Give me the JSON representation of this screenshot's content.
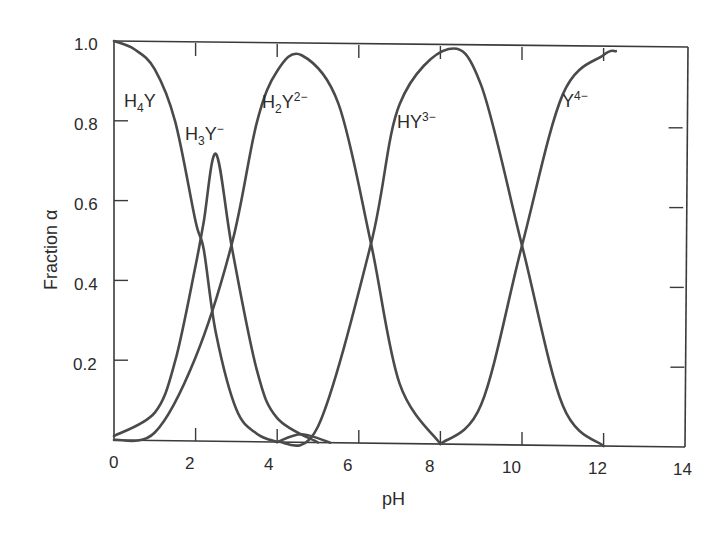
{
  "chart_data": {
    "type": "line",
    "title": "",
    "xlabel": "pH",
    "ylabel": "Fraction α",
    "xlim": [
      0,
      14
    ],
    "ylim": [
      0,
      1.0
    ],
    "grid": false,
    "legend": "inline labels",
    "x_ticks": [
      "0",
      "2",
      "4",
      "6",
      "8",
      "10",
      "12",
      "14"
    ],
    "y_ticks": [
      "0.2",
      "0.4",
      "0.6",
      "0.8",
      "1.0"
    ],
    "pKa": [
      2.1,
      2.9,
      6.3,
      10.0
    ],
    "series": [
      {
        "name": "H4Y",
        "label_main": "H",
        "label_sub": "4",
        "label_tail": "Y",
        "label_sup": "",
        "x": [
          0,
          0.5,
          1.0,
          1.5,
          2.0,
          2.2,
          2.5,
          3.0,
          3.5,
          4.0
        ],
        "values": [
          1.0,
          0.98,
          0.93,
          0.8,
          0.55,
          0.48,
          0.27,
          0.08,
          0.02,
          0.0
        ]
      },
      {
        "name": "H3Y-",
        "label_main": "H",
        "label_sub": "3",
        "label_tail": "Y",
        "label_sup": "−",
        "x": [
          0,
          1.0,
          1.5,
          2.0,
          2.2,
          2.5,
          2.9,
          3.5,
          4.0,
          5.0
        ],
        "values": [
          0.01,
          0.07,
          0.2,
          0.44,
          0.55,
          0.72,
          0.48,
          0.18,
          0.06,
          0.0
        ]
      },
      {
        "name": "H2Y2-",
        "label_main": "H",
        "label_sub": "2",
        "label_tail": "Y",
        "label_sup": "2−",
        "x": [
          0,
          1.0,
          2.0,
          2.9,
          3.5,
          4.0,
          4.6,
          5.5,
          6.3,
          7.0,
          8.0
        ],
        "values": [
          0.0,
          0.02,
          0.21,
          0.5,
          0.8,
          0.93,
          0.97,
          0.85,
          0.5,
          0.15,
          0.0
        ]
      },
      {
        "name": "HY3-",
        "label_main": "HY",
        "label_sub": "",
        "label_tail": "",
        "label_sup": "3−",
        "x": [
          4.0,
          5.0,
          6.3,
          7.0,
          8.2,
          9.0,
          10.0,
          11.0,
          12.0
        ],
        "values": [
          0.0,
          0.04,
          0.5,
          0.85,
          0.99,
          0.9,
          0.5,
          0.1,
          0.0
        ]
      },
      {
        "name": "Y4-",
        "label_main": "Y",
        "label_sub": "",
        "label_tail": "",
        "label_sup": "4−",
        "x": [
          8.0,
          9.0,
          10.0,
          11.0,
          12.0,
          12.3
        ],
        "values": [
          0.0,
          0.1,
          0.5,
          0.88,
          0.98,
          0.99
        ]
      },
      {
        "name": "minor-bump",
        "label_main": "",
        "label_sub": "",
        "label_tail": "",
        "label_sup": "",
        "x": [
          4.0,
          4.6,
          5.3
        ],
        "values": [
          0.0,
          0.02,
          0.0
        ]
      }
    ]
  },
  "labels": {
    "xlabel": "pH",
    "ylabel": "Fraction α",
    "x_ticks": [
      "0",
      "2",
      "4",
      "6",
      "8",
      "10",
      "12",
      "14"
    ],
    "y_ticks": [
      "0.2",
      "0.4",
      "0.6",
      "0.8",
      "1.0"
    ],
    "species": [
      {
        "main": "H",
        "sub": "4",
        "tail": "Y",
        "sup": ""
      },
      {
        "main": "H",
        "sub": "3",
        "tail": "Y",
        "sup": "−"
      },
      {
        "main": "H",
        "sub": "2",
        "tail": "Y",
        "sup": "2−"
      },
      {
        "main": "HY",
        "sub": "",
        "tail": "",
        "sup": "3−"
      },
      {
        "main": "Y",
        "sub": "",
        "tail": "",
        "sup": "4−"
      }
    ]
  },
  "colors": {
    "line": "#4a4a4a",
    "frame": "#3a3a3a",
    "text": "#2b2b2b"
  }
}
